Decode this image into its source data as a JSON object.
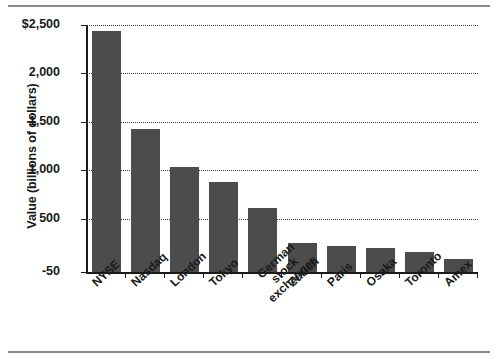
{
  "chart_data": {
    "type": "bar",
    "title": "",
    "subtitle": "",
    "xlabel": "",
    "ylabel": "Value (billions of dollars)",
    "categories": [
      "NYSE",
      "Nasdaq",
      "London",
      "Tokyo",
      "German stock exchanges",
      "Zurich",
      "Paris",
      "Osaka",
      "Toronto",
      "Amex"
    ],
    "values": [
      2440,
      1430,
      1030,
      880,
      615,
      250,
      215,
      195,
      155,
      80
    ],
    "ylim": [
      -50,
      2500
    ],
    "ytick_values": [
      2500,
      2000,
      1500,
      1000,
      500,
      -50
    ],
    "ytick_labels": [
      "$2,500",
      "2,000",
      "1,500",
      "1,000",
      "500",
      "-50"
    ],
    "grid": true,
    "grid_style": "dotted-horizontal",
    "legend": "none",
    "bar_color": "#4c4c4c",
    "axis_color": "#1a1a1a",
    "background_color": "#ffffff"
  }
}
